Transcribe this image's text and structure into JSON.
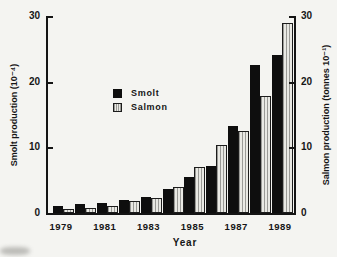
{
  "figure": {
    "background": "#f4f4f1",
    "bar_black": "#0e0e0e",
    "bar_hatch_fill": "#e9e9e4",
    "bar_hatch_line": "#9a9a96",
    "axis_color": "#141414"
  },
  "chart_data": {
    "type": "bar",
    "title": "",
    "categories": [
      1979,
      1980,
      1981,
      1982,
      1983,
      1984,
      1985,
      1986,
      1987,
      1988,
      1989
    ],
    "series": [
      {
        "name": "Smolt",
        "style": "solid",
        "color": "#0e0e0e",
        "values": [
          1.0,
          1.4,
          1.5,
          2.0,
          2.5,
          3.7,
          5.5,
          7.2,
          13.3,
          22.5,
          24.0
        ]
      },
      {
        "name": "Salmon",
        "style": "hatched",
        "color": "#e9e9e4",
        "values": [
          0.6,
          0.8,
          1.0,
          1.8,
          2.3,
          4.0,
          7.0,
          10.3,
          12.5,
          17.8,
          29.0
        ]
      }
    ],
    "xlabel": "Year",
    "ylabel_left": "Smolt production (10⁻⁴)",
    "ylabel_right": "Salmon production (tonnes 10⁻¹)",
    "ylim": [
      0,
      30
    ],
    "yticks": [
      0,
      10,
      20,
      30
    ],
    "xtick_labels": [
      "1979",
      "1981",
      "1983",
      "1985",
      "1987",
      "1989"
    ],
    "xtick_indices": [
      0,
      2,
      4,
      6,
      8,
      10
    ],
    "grid": false,
    "legend": {
      "position": "center-left",
      "entries": [
        "Smolt",
        "Salmon"
      ]
    }
  }
}
